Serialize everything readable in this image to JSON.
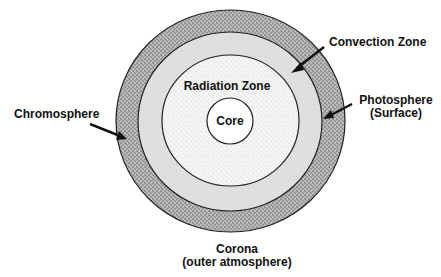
{
  "diagram": {
    "layers": [
      {
        "name": "Chromosphere",
        "fill": "#9c9c9c"
      },
      {
        "name": "Convection Zone",
        "fill": "#dfdfdf"
      },
      {
        "name": "Radiation Zone",
        "fill": "#f2f2f2"
      },
      {
        "name": "Core",
        "fill": "#ffffff"
      }
    ],
    "labels": {
      "convection": "Convection Zone",
      "radiation": "Radiation Zone",
      "core": "Core",
      "chromosphere": "Chromosphere",
      "photosphere_line1": "Photosphere",
      "photosphere_line2": "(Surface)",
      "corona_line1": "Corona",
      "corona_line2": "(outer atmosphere)"
    },
    "colors": {
      "outline": "#222222",
      "text": "#111111",
      "arrow": "#111111"
    }
  }
}
